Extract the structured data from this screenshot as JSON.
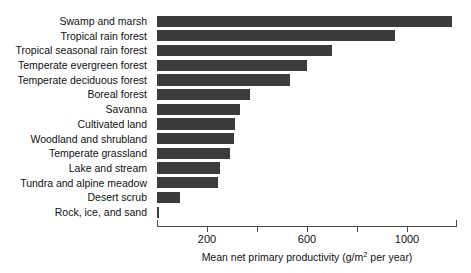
{
  "chart_data": {
    "type": "bar",
    "orientation": "horizontal",
    "title": "",
    "xlabel": "Mean net primary productivity (g/m2 per year)",
    "xlabel_prefix": "Mean net primary productivity (g/m",
    "xlabel_exponent": "2",
    "xlabel_suffix": " per year)",
    "ylabel": "",
    "xlim": [
      0,
      1200
    ],
    "grid": false,
    "legend": null,
    "bar_color": "#3b3b3b",
    "axis_color": "#4a4a4a",
    "tick_values": [
      200,
      400,
      600,
      800,
      1000
    ],
    "tick_labels_shown": [
      "200",
      "",
      "600",
      "",
      "1000"
    ],
    "categories": [
      "Swamp and marsh",
      "Tropical rain forest",
      "Tropical seasonal rain forest",
      "Temperate evergreen forest",
      "Temperate deciduous forest",
      "Boreal forest",
      "Savanna",
      "Cultivated land",
      "Woodland and shrubland",
      "Temperate grassland",
      "Lake and stream",
      "Tundra and alpine meadow",
      "Desert scrub",
      "Rock, ice, and sand"
    ],
    "values": [
      1180,
      950,
      700,
      600,
      530,
      370,
      330,
      310,
      308,
      290,
      250,
      245,
      90,
      8
    ]
  }
}
